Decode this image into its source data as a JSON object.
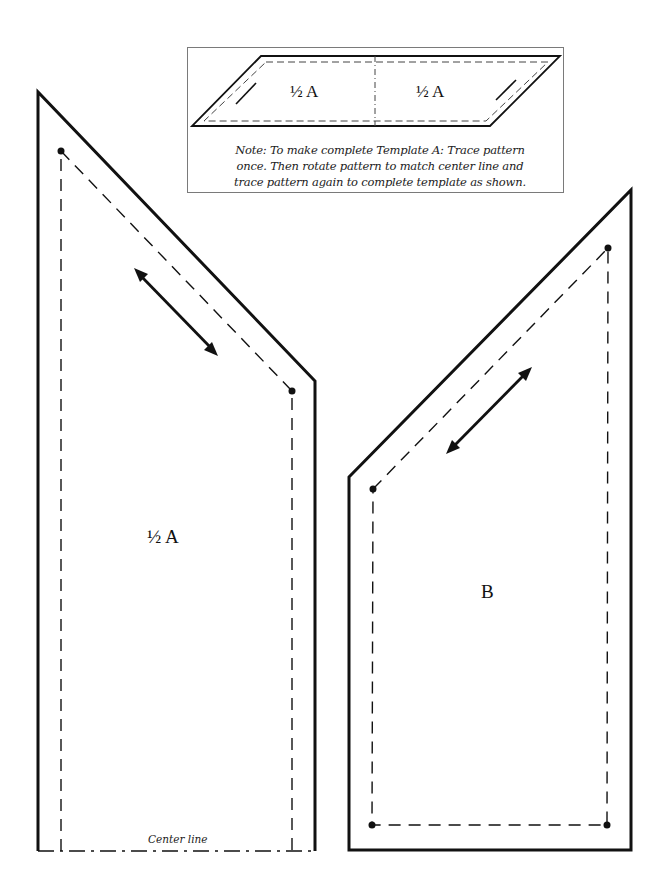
{
  "note_box": {
    "diagram_labels": [
      "½ A",
      "½ A"
    ],
    "note": "Note: To make complete Template A: Trace pattern once. Then rotate pattern to match center line and trace pattern again to complete template as shown.",
    "note_lines": [
      "Note: To make complete Template A: Trace pattern",
      "once. Then rotate pattern to match center line and",
      "trace pattern again to complete template as shown."
    ]
  },
  "template_a_half": {
    "label": "½ A",
    "center_line_label": "Center line"
  },
  "template_b": {
    "label": "B"
  },
  "colors": {
    "line": "#111111",
    "box_border": "#7a7a7a"
  }
}
